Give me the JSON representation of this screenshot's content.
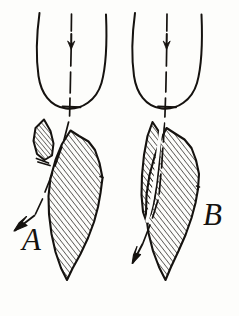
{
  "figure": {
    "type": "hand-drawn-line-diagram",
    "background_color": "#fdfdfb",
    "ink_color": "#15120f",
    "panels": [
      {
        "id": "A",
        "label": "A",
        "label_position": {
          "x": 22,
          "y": 247
        },
        "fragment_gap": "wide",
        "deflection": "strong-left",
        "parts": [
          {
            "name": "rounded-body-outline",
            "shape": "open-top U curve"
          },
          {
            "name": "axis-dashed-line",
            "orientation": "vertical then deflected down-left"
          },
          {
            "name": "inner-down-arrow",
            "direction": "down"
          },
          {
            "name": "left-hatched-sliver",
            "hatch": "diagonal"
          },
          {
            "name": "right-hatched-block",
            "hatch": "diagonal"
          },
          {
            "name": "exit-arrow",
            "direction": "down-left"
          }
        ]
      },
      {
        "id": "B",
        "label": "B",
        "label_position": {
          "x": 205,
          "y": 222
        },
        "fragment_gap": "narrow",
        "deflection": "slight-left",
        "parts": [
          {
            "name": "rounded-body-outline",
            "shape": "open-top U curve"
          },
          {
            "name": "axis-dashed-line",
            "orientation": "vertical then slightly deflected down-left"
          },
          {
            "name": "inner-down-arrow",
            "direction": "down"
          },
          {
            "name": "left-hatched-blade",
            "hatch": "diagonal"
          },
          {
            "name": "right-hatched-block",
            "hatch": "diagonal"
          },
          {
            "name": "exit-arrow",
            "direction": "down-left"
          }
        ]
      }
    ]
  }
}
